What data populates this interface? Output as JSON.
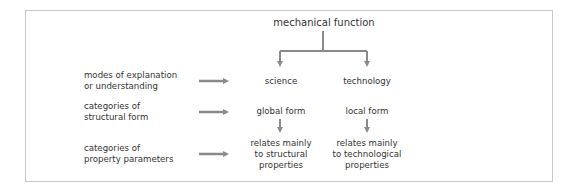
{
  "diagram": {
    "title": "mechanical function",
    "columns": [
      {
        "name": "science",
        "form": "global form",
        "property_lines": [
          "relates mainly",
          "to structural",
          "properties"
        ]
      },
      {
        "name": "technology",
        "form": "local form",
        "property_lines": [
          "relates mainly",
          "to technological",
          "properties"
        ]
      }
    ],
    "rows": [
      {
        "label_lines": [
          "modes of explanation",
          "or understanding"
        ]
      },
      {
        "label_lines": [
          "categories of",
          "structural form"
        ]
      },
      {
        "label_lines": [
          "categories of",
          "property parameters"
        ]
      }
    ],
    "colors": {
      "arrow": "#8a8a8a",
      "text": "#333333",
      "border": "#c8c8c8"
    }
  }
}
